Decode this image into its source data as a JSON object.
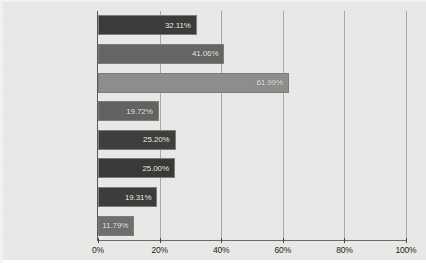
{
  "chart_data": {
    "type": "bar",
    "orientation": "horizontal",
    "title": "",
    "xlabel": "",
    "ylabel": "",
    "xlim": [
      0,
      100
    ],
    "grid": true,
    "legend": "none",
    "xticks": [
      "0%",
      "20%",
      "40%",
      "60%",
      "80%",
      "100%"
    ],
    "xtick_values": [
      0,
      20,
      40,
      60,
      80,
      100
    ],
    "categories": [
      "Calories burnt",
      "Distance",
      "Steps taken",
      "Speed",
      "Heart rate",
      "Hours slept",
      "Food intake",
      "Other (Please specify)"
    ],
    "values": [
      32.11,
      41.06,
      61.99,
      19.72,
      25.2,
      25.0,
      19.31,
      11.79
    ],
    "data_labels": [
      "32.11%",
      "41.06%",
      "61.99%",
      "19.72%",
      "25.20%",
      "25.00%",
      "19.31%",
      "11.79%"
    ],
    "bar_colors": [
      "#3c3c3a",
      "#666664",
      "#8e8e8c",
      "#636361",
      "#3f3f3d",
      "#3a3a38",
      "#3d3d3b",
      "#6f6f6d"
    ],
    "background_color": "#e9e9e7",
    "gridline_color": "#a9a9a7",
    "axis_color": "#5a5a58",
    "label_text_color": "#1d1d1b",
    "value_text_color": "#f3f3f1"
  }
}
